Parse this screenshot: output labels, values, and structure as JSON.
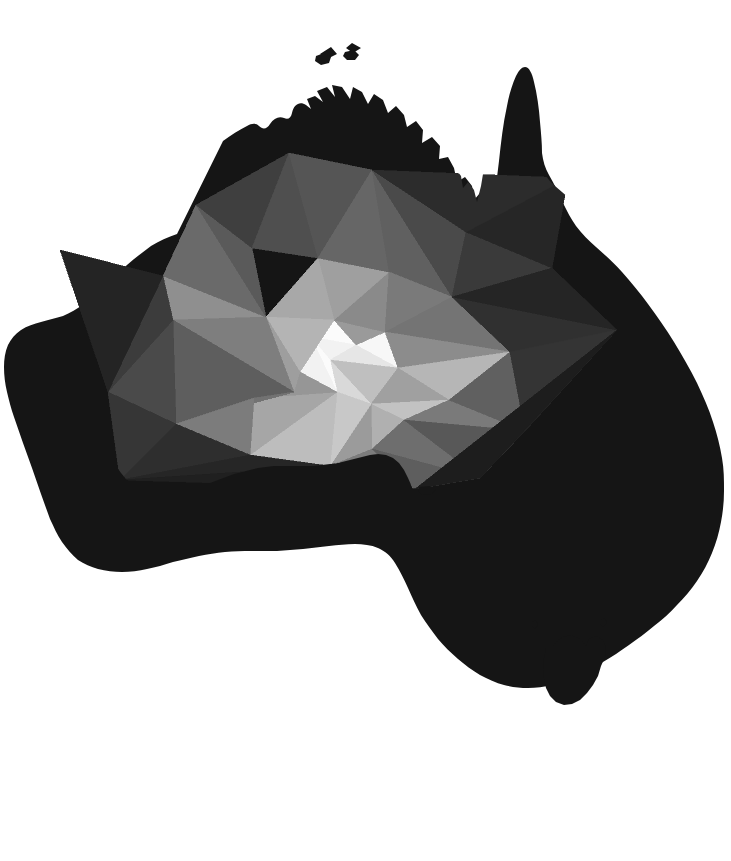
{
  "document": {
    "title": "Low-poly map of Australia",
    "kind": "map-illustration",
    "background_color": "#ffffff",
    "width": 731,
    "height": 861
  },
  "map": {
    "subject": "Australia",
    "style": "low-poly triangulated silhouette",
    "palette_description": "grayscale radial gradient, brightest near the continental centre, near-black at the coasts",
    "regions": [
      {
        "name": "mainland-australia"
      },
      {
        "name": "tasmania"
      },
      {
        "name": "melville-island"
      },
      {
        "name": "bathurst-island"
      },
      {
        "name": "kangaroo-island"
      },
      {
        "name": "king-island"
      },
      {
        "name": "flinders-island"
      }
    ],
    "colors": {
      "background": "#ffffff",
      "silhouette_base": "#1a1a1a",
      "edge_black": "#131313",
      "near_black": "#1e1e1e",
      "dark_1": "#262626",
      "dark_2": "#2e2e2e",
      "dark_3": "#363636",
      "mid_dark_1": "#3f3f3f",
      "mid_dark_2": "#484848",
      "mid_1": "#525252",
      "mid_2": "#5c5c5c",
      "mid_3": "#666666",
      "mid_4": "#707070",
      "mid_light_1": "#7a7a7a",
      "mid_light_2": "#848484",
      "light_1": "#8f8f8f",
      "light_2": "#9a9a9a",
      "light_3": "#a6a6a6",
      "light_4": "#b2b2b2",
      "light_5": "#bfbfbf",
      "light_6": "#cccccc",
      "light_7": "#d9d9d9",
      "light_8": "#e6e6e6",
      "highlight": "#f2f2f2",
      "highlight_peak": "#fbfbfb"
    }
  },
  "chart_data": {
    "type": "map",
    "xlabel": "",
    "ylabel": "",
    "legend": [],
    "note": "Triangle mesh covering the Australian landmass; fill lightness encodes distance from the continental interior."
  },
  "mesh": {
    "vertex_count": 38,
    "triangle_count": 62,
    "vertices": [
      [
        334,
        320
      ],
      [
        311,
        337
      ],
      [
        356,
        345
      ],
      [
        330,
        360
      ],
      [
        385,
        332
      ],
      [
        398,
        368
      ],
      [
        337,
        392
      ],
      [
        371,
        404
      ],
      [
        300,
        372
      ],
      [
        266,
        317
      ],
      [
        252,
        248
      ],
      [
        318,
        258
      ],
      [
        389,
        272
      ],
      [
        452,
        297
      ],
      [
        466,
        232
      ],
      [
        372,
        170
      ],
      [
        289,
        153
      ],
      [
        196,
        205
      ],
      [
        163,
        276
      ],
      [
        173,
        320
      ],
      [
        176,
        424
      ],
      [
        250,
        455
      ],
      [
        294,
        392
      ],
      [
        254,
        398
      ],
      [
        330,
        466
      ],
      [
        372,
        449
      ],
      [
        404,
        420
      ],
      [
        449,
        400
      ],
      [
        510,
        352
      ],
      [
        525,
        431
      ],
      [
        480,
        478
      ],
      [
        415,
        489
      ],
      [
        552,
        268
      ],
      [
        568,
        178
      ],
      [
        108,
        392
      ],
      [
        120,
        480
      ],
      [
        60,
        250
      ],
      [
        617,
        330
      ]
    ],
    "triangles": [
      {
        "v": [
          0,
          1,
          2
        ],
        "fill": "#fbfbfb",
        "name": "tri-core-highlight"
      },
      {
        "v": [
          1,
          3,
          2
        ],
        "fill": "#f2f2f2",
        "name": "tri-core-bright"
      },
      {
        "v": [
          2,
          4,
          5
        ],
        "fill": "#f7f7f7",
        "name": "tri-core-east-bright"
      },
      {
        "v": [
          2,
          5,
          3
        ],
        "fill": "#e6e6e6",
        "name": "tri-core-south-bright"
      },
      {
        "v": [
          3,
          5,
          7
        ],
        "fill": "#bfbfbf",
        "name": "tri-south-mid"
      },
      {
        "v": [
          3,
          7,
          6
        ],
        "fill": "#d9d9d9",
        "name": "tri-south-light"
      },
      {
        "v": [
          1,
          3,
          6
        ],
        "fill": "#fbfbfb",
        "name": "tri-southwest-bright"
      },
      {
        "v": [
          1,
          6,
          8
        ],
        "fill": "#f2f2f2",
        "name": "tri-west-bright"
      },
      {
        "v": [
          0,
          1,
          8
        ],
        "fill": "#d0d0d0",
        "name": "tri-west-mid"
      },
      {
        "v": [
          0,
          2,
          4
        ],
        "fill": "#9a9a9a",
        "name": "tri-north-core"
      },
      {
        "v": [
          0,
          4,
          12
        ],
        "fill": "#8a8a8a",
        "name": "tri-north-upper"
      },
      {
        "v": [
          0,
          12,
          11
        ],
        "fill": "#9f9f9f",
        "name": "tri-north-left"
      },
      {
        "v": [
          0,
          11,
          9
        ],
        "fill": "#a8a8a8",
        "name": "tri-northwest-core"
      },
      {
        "v": [
          0,
          9,
          8
        ],
        "fill": "#b4b4b4",
        "name": "tri-west-core"
      },
      {
        "v": [
          9,
          19,
          18
        ],
        "fill": "#8f8f8f",
        "name": "tri-west-outer"
      },
      {
        "v": [
          9,
          18,
          17
        ],
        "fill": "#6a6a6a",
        "name": "tri-northwest-outer"
      },
      {
        "v": [
          9,
          17,
          10
        ],
        "fill": "#5a5a5a",
        "name": "tri-kimberley-south"
      },
      {
        "v": [
          10,
          17,
          16
        ],
        "fill": "#3f3f3f",
        "name": "tri-kimberley"
      },
      {
        "v": [
          10,
          16,
          11
        ],
        "fill": "#4f4f4f",
        "name": "tri-top-end-west"
      },
      {
        "v": [
          11,
          16,
          15
        ],
        "fill": "#555555",
        "name": "tri-top-end"
      },
      {
        "v": [
          11,
          15,
          12
        ],
        "fill": "#666666",
        "name": "tri-arnhem-south"
      },
      {
        "v": [
          12,
          15,
          13
        ],
        "fill": "#606060",
        "name": "tri-gulf-west"
      },
      {
        "v": [
          13,
          15,
          14
        ],
        "fill": "#4a4a4a",
        "name": "tri-gulf"
      },
      {
        "v": [
          13,
          14,
          32
        ],
        "fill": "#3a3a3a",
        "name": "tri-cape-york-base"
      },
      {
        "v": [
          14,
          33,
          32
        ],
        "fill": "#262626",
        "name": "tri-cape-york"
      },
      {
        "v": [
          14,
          15,
          33
        ],
        "fill": "#2c2c2c",
        "name": "tri-gulf-north"
      },
      {
        "v": [
          4,
          12,
          13
        ],
        "fill": "#7a7a7a",
        "name": "tri-centre-north-east"
      },
      {
        "v": [
          4,
          13,
          28
        ],
        "fill": "#747474",
        "name": "tri-centre-east"
      },
      {
        "v": [
          4,
          28,
          5
        ],
        "fill": "#8c8c8c",
        "name": "tri-east-mid"
      },
      {
        "v": [
          5,
          28,
          27
        ],
        "fill": "#b6b6b6",
        "name": "tri-east-light"
      },
      {
        "v": [
          5,
          27,
          7
        ],
        "fill": "#a0a0a0",
        "name": "tri-southeast-light"
      },
      {
        "v": [
          7,
          27,
          26
        ],
        "fill": "#c2c2c2",
        "name": "tri-southeast-mid"
      },
      {
        "v": [
          7,
          26,
          25
        ],
        "fill": "#b0b0b0",
        "name": "tri-victoria-light"
      },
      {
        "v": [
          7,
          25,
          24
        ],
        "fill": "#9b9b9b",
        "name": "tri-victoria"
      },
      {
        "v": [
          6,
          7,
          24
        ],
        "fill": "#c8c8c8",
        "name": "tri-south-coast-mid"
      },
      {
        "v": [
          6,
          24,
          21
        ],
        "fill": "#bdbdbd",
        "name": "tri-south-coast-west"
      },
      {
        "v": [
          6,
          21,
          23
        ],
        "fill": "#a6a6a6",
        "name": "tri-bight-east"
      },
      {
        "v": [
          6,
          23,
          8
        ],
        "fill": "#969696",
        "name": "tri-bight-mid"
      },
      {
        "v": [
          8,
          23,
          22
        ],
        "fill": "#8c8c8c",
        "name": "tri-nullarbor-north"
      },
      {
        "v": [
          8,
          22,
          9
        ],
        "fill": "#9e9e9e",
        "name": "tri-interior-west"
      },
      {
        "v": [
          9,
          22,
          19
        ],
        "fill": "#7e7e7e",
        "name": "tri-west-interior"
      },
      {
        "v": [
          19,
          22,
          20
        ],
        "fill": "#5e5e5e",
        "name": "tri-west-south"
      },
      {
        "v": [
          22,
          23,
          20
        ],
        "fill": "#727272",
        "name": "tri-nullarbor-west"
      },
      {
        "v": [
          23,
          21,
          20
        ],
        "fill": "#7c7c7c",
        "name": "tri-bight-coast"
      },
      {
        "v": [
          19,
          20,
          34
        ],
        "fill": "#4a4a4a",
        "name": "tri-west-coast-mid"
      },
      {
        "v": [
          19,
          34,
          18
        ],
        "fill": "#3c3c3c",
        "name": "tri-west-coast-north"
      },
      {
        "v": [
          18,
          34,
          36
        ],
        "fill": "#242424",
        "name": "tri-pilbara-coast"
      },
      {
        "v": [
          20,
          34,
          35
        ],
        "fill": "#363636",
        "name": "tri-southwest-coast"
      },
      {
        "v": [
          20,
          35,
          21
        ],
        "fill": "#2e2e2e",
        "name": "tri-southwest-tip"
      },
      {
        "v": [
          24,
          25,
          31
        ],
        "fill": "#7c7c7c",
        "name": "tri-south-victoria"
      },
      {
        "v": [
          25,
          26,
          30
        ],
        "fill": "#6e6e6e",
        "name": "tri-gippsland"
      },
      {
        "v": [
          25,
          30,
          31
        ],
        "fill": "#5e5e5e",
        "name": "tri-victoria-coast"
      },
      {
        "v": [
          26,
          27,
          29
        ],
        "fill": "#7a7a7a",
        "name": "tri-nsw-inland"
      },
      {
        "v": [
          26,
          29,
          30
        ],
        "fill": "#585858",
        "name": "tri-nsw-south"
      },
      {
        "v": [
          27,
          28,
          29
        ],
        "fill": "#606060",
        "name": "tri-nsw-north"
      },
      {
        "v": [
          28,
          13,
          37
        ],
        "fill": "#303030",
        "name": "tri-queensland-inland"
      },
      {
        "v": [
          28,
          37,
          29
        ],
        "fill": "#343434",
        "name": "tri-queensland-south"
      },
      {
        "v": [
          13,
          32,
          37
        ],
        "fill": "#252525",
        "name": "tri-queensland-north"
      },
      {
        "v": [
          29,
          37,
          30
        ],
        "fill": "#222222",
        "name": "tri-nsw-coast"
      },
      {
        "v": [
          30,
          37,
          31
        ],
        "fill": "#1d1d1d",
        "name": "tri-southeast-coast"
      },
      {
        "v": [
          21,
          35,
          24
        ],
        "fill": "#262626",
        "name": "tri-south-australia-coast"
      },
      {
        "v": [
          24,
          35,
          31
        ],
        "fill": "#202020",
        "name": "tri-sa-southeast"
      }
    ]
  }
}
